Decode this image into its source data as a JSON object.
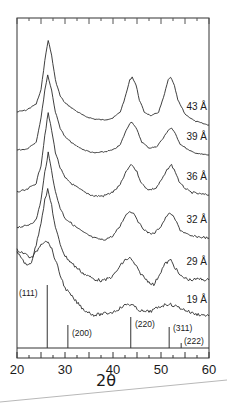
{
  "chart_data": {
    "type": "line",
    "title": "",
    "xlabel": "2θ",
    "ylabel": "",
    "xlim": [
      20,
      60
    ],
    "x_ticks": [
      20,
      30,
      40,
      50,
      60
    ],
    "x_minor_step": 2.5,
    "grid": false,
    "legend_position": "inline-right",
    "series": [
      {
        "name": "43 Å",
        "label_y": 110,
        "points": [
          [
            20,
            112
          ],
          [
            22,
            110
          ],
          [
            24,
            104
          ],
          [
            25,
            90
          ],
          [
            25.8,
            60
          ],
          [
            26.5,
            40
          ],
          [
            27.2,
            55
          ],
          [
            28,
            80
          ],
          [
            29,
            96
          ],
          [
            30,
            103
          ],
          [
            32,
            110
          ],
          [
            34,
            116
          ],
          [
            36,
            119
          ],
          [
            38,
            120
          ],
          [
            40,
            118
          ],
          [
            41.5,
            112
          ],
          [
            42.5,
            98
          ],
          [
            43.5,
            80
          ],
          [
            44,
            77
          ],
          [
            44.8,
            85
          ],
          [
            45.5,
            100
          ],
          [
            46.5,
            112
          ],
          [
            48,
            116
          ],
          [
            49.5,
            112
          ],
          [
            50.5,
            98
          ],
          [
            51.5,
            80
          ],
          [
            52,
            77
          ],
          [
            52.8,
            86
          ],
          [
            53.5,
            100
          ],
          [
            55,
            114
          ],
          [
            57,
            121
          ],
          [
            59,
            124
          ],
          [
            60,
            125
          ]
        ]
      },
      {
        "name": "39 Å",
        "label_y": 140,
        "points": [
          [
            20,
            150
          ],
          [
            22,
            149
          ],
          [
            24,
            142
          ],
          [
            25,
            118
          ],
          [
            25.8,
            90
          ],
          [
            26.4,
            75
          ],
          [
            27.2,
            90
          ],
          [
            28,
            112
          ],
          [
            29,
            128
          ],
          [
            30,
            137
          ],
          [
            32,
            145
          ],
          [
            34,
            150
          ],
          [
            36,
            153
          ],
          [
            38,
            152
          ],
          [
            40,
            150
          ],
          [
            41.5,
            145
          ],
          [
            42.5,
            133
          ],
          [
            43.5,
            123
          ],
          [
            44,
            122
          ],
          [
            45,
            130
          ],
          [
            46,
            142
          ],
          [
            47.5,
            148
          ],
          [
            49,
            147
          ],
          [
            50.5,
            138
          ],
          [
            51.5,
            130
          ],
          [
            52.2,
            128
          ],
          [
            53,
            134
          ],
          [
            54,
            144
          ],
          [
            56,
            151
          ],
          [
            58,
            154
          ],
          [
            60,
            155
          ]
        ]
      },
      {
        "name": "36 Å",
        "label_y": 180,
        "points": [
          [
            20,
            192
          ],
          [
            22,
            190
          ],
          [
            24,
            183
          ],
          [
            25,
            165
          ],
          [
            25.8,
            135
          ],
          [
            26.5,
            113
          ],
          [
            27.2,
            130
          ],
          [
            28,
            152
          ],
          [
            29,
            168
          ],
          [
            30,
            178
          ],
          [
            32,
            186
          ],
          [
            34,
            192
          ],
          [
            36,
            196
          ],
          [
            38,
            196
          ],
          [
            40,
            192
          ],
          [
            41.5,
            185
          ],
          [
            42.5,
            174
          ],
          [
            43.5,
            166
          ],
          [
            44,
            165
          ],
          [
            45,
            172
          ],
          [
            46,
            184
          ],
          [
            47.5,
            190
          ],
          [
            49,
            188
          ],
          [
            50.5,
            177
          ],
          [
            51.5,
            168
          ],
          [
            52.2,
            165
          ],
          [
            53,
            172
          ],
          [
            54,
            184
          ],
          [
            56,
            192
          ],
          [
            58,
            194
          ],
          [
            60,
            195
          ]
        ]
      },
      {
        "name": "32 Å",
        "label_y": 223,
        "points": [
          [
            20,
            227
          ],
          [
            22,
            226
          ],
          [
            24,
            220
          ],
          [
            25,
            200
          ],
          [
            25.8,
            172
          ],
          [
            26.5,
            153
          ],
          [
            27.2,
            170
          ],
          [
            28,
            192
          ],
          [
            29,
            208
          ],
          [
            30,
            218
          ],
          [
            32,
            226
          ],
          [
            34,
            233
          ],
          [
            36,
            238
          ],
          [
            38,
            240
          ],
          [
            40,
            236
          ],
          [
            41.5,
            226
          ],
          [
            42.5,
            216
          ],
          [
            43.5,
            211
          ],
          [
            44.5,
            214
          ],
          [
            45.5,
            224
          ],
          [
            47,
            232
          ],
          [
            48.5,
            234
          ],
          [
            50,
            226
          ],
          [
            51.2,
            216
          ],
          [
            52,
            213
          ],
          [
            53,
            220
          ],
          [
            54,
            230
          ],
          [
            56,
            236
          ],
          [
            58,
            237
          ],
          [
            60,
            238
          ]
        ]
      },
      {
        "name": "29 Å",
        "label_y": 265,
        "points": [
          [
            20,
            253
          ],
          [
            21,
            258
          ],
          [
            22,
            266
          ],
          [
            23,
            262
          ],
          [
            24,
            245
          ],
          [
            25,
            222
          ],
          [
            25.8,
            200
          ],
          [
            26.4,
            190
          ],
          [
            27.2,
            205
          ],
          [
            28,
            228
          ],
          [
            29,
            244
          ],
          [
            30,
            256
          ],
          [
            32,
            266
          ],
          [
            34,
            274
          ],
          [
            36,
            279
          ],
          [
            38,
            281
          ],
          [
            40,
            276
          ],
          [
            41.5,
            266
          ],
          [
            42.5,
            260
          ],
          [
            43.5,
            258
          ],
          [
            44.5,
            264
          ],
          [
            45.5,
            272
          ],
          [
            47,
            280
          ],
          [
            48.5,
            285
          ],
          [
            49.5,
            276
          ],
          [
            50.8,
            264
          ],
          [
            52,
            260
          ],
          [
            53,
            268
          ],
          [
            54,
            276
          ],
          [
            56,
            280
          ],
          [
            58,
            279
          ],
          [
            60,
            280
          ]
        ]
      },
      {
        "name": "19 Å",
        "label_y": 303,
        "points": [
          [
            20,
            250
          ],
          [
            21,
            252
          ],
          [
            22,
            255
          ],
          [
            23,
            258
          ],
          [
            24,
            252
          ],
          [
            25,
            244
          ],
          [
            26,
            240
          ],
          [
            27,
            246
          ],
          [
            28,
            260
          ],
          [
            29,
            275
          ],
          [
            30,
            288
          ],
          [
            32,
            300
          ],
          [
            34,
            310
          ],
          [
            36,
            315
          ],
          [
            38,
            314
          ],
          [
            40,
            312
          ],
          [
            41.5,
            308
          ],
          [
            43,
            304
          ],
          [
            44,
            305
          ],
          [
            45,
            309
          ],
          [
            46.5,
            312
          ],
          [
            48,
            311
          ],
          [
            50,
            306
          ],
          [
            51.5,
            304
          ],
          [
            53,
            306
          ],
          [
            55,
            310
          ],
          [
            57,
            314
          ],
          [
            59,
            315
          ],
          [
            60,
            316
          ]
        ]
      }
    ],
    "reference_lines": [
      {
        "label": "(111)",
        "x": 26.3,
        "top_y": 285,
        "label_x": 19,
        "label_y": 296
      },
      {
        "label": "(200)",
        "x": 30.6,
        "top_y": 325,
        "label_x": 72,
        "label_y": 336
      },
      {
        "label": "(220)",
        "x": 43.7,
        "top_y": 317,
        "label_x": 135,
        "label_y": 327
      },
      {
        "label": "(311)",
        "x": 51.7,
        "top_y": 327,
        "label_x": 173,
        "label_y": 331
      },
      {
        "label": "(222)",
        "x": 54.2,
        "top_y": 343,
        "label_x": 184,
        "label_y": 344
      }
    ],
    "colors": {
      "line": "#2a2a2a",
      "frame": "#333333",
      "underline": "#b8b8b8"
    }
  }
}
